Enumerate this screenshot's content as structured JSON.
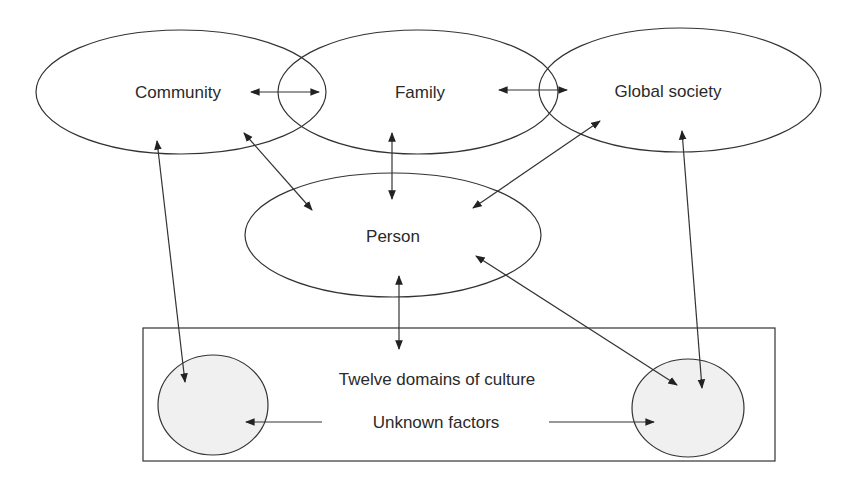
{
  "diagram": {
    "nodes": {
      "community": {
        "label": "Community"
      },
      "family": {
        "label": "Family"
      },
      "global_society": {
        "label": "Global society"
      },
      "person": {
        "label": "Person"
      },
      "culture_box": {
        "label": "Twelve domains of culture"
      },
      "unknown_factors": {
        "label": "Unknown factors"
      }
    },
    "edges": [
      {
        "from": "Community",
        "to": "Family",
        "type": "bidirectional"
      },
      {
        "from": "Family",
        "to": "Global society",
        "type": "bidirectional"
      },
      {
        "from": "Community",
        "to": "Person",
        "type": "bidirectional"
      },
      {
        "from": "Family",
        "to": "Person",
        "type": "bidirectional"
      },
      {
        "from": "Global society",
        "to": "Person",
        "type": "bidirectional"
      },
      {
        "from": "Person",
        "to": "Twelve domains of culture",
        "type": "bidirectional"
      },
      {
        "from": "Community",
        "to": "Unknown factors (left)",
        "type": "bidirectional"
      },
      {
        "from": "Global society",
        "to": "Unknown factors (right)",
        "type": "bidirectional"
      },
      {
        "from": "Person",
        "to": "Unknown factors (right)",
        "type": "bidirectional"
      },
      {
        "from": "Unknown factors label",
        "to": "Unknown factors (left)",
        "type": "directed"
      },
      {
        "from": "Unknown factors label",
        "to": "Unknown factors (right)",
        "type": "directed"
      }
    ],
    "colors": {
      "stroke": "#333333",
      "text": "#2a2a2a",
      "shaded_fill": "#f0f0f0",
      "background": "#ffffff"
    }
  }
}
